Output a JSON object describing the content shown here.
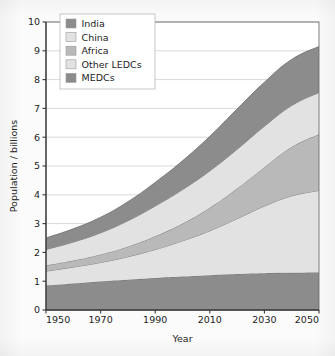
{
  "chart_data": {
    "type": "area",
    "title": "",
    "subtitle": "",
    "xlabel": "Year",
    "ylabel": "Population / billions",
    "xlim": [
      1950,
      2050
    ],
    "ylim": [
      0,
      10
    ],
    "grid": true,
    "stacked": true,
    "legend_position": "top-left",
    "xticks": [
      1950,
      1970,
      1990,
      2010,
      2030,
      2050
    ],
    "xtick_labels": [
      "1950",
      "1970",
      "1990",
      "2010",
      "2030",
      "2050"
    ],
    "yticks": [
      0,
      1,
      2,
      3,
      4,
      5,
      6,
      7,
      8,
      9,
      10
    ],
    "ytick_labels": [
      "0",
      "1",
      "2",
      "3",
      "4",
      "5",
      "6",
      "7",
      "8",
      "9",
      "10"
    ],
    "x": [
      1950,
      1960,
      1970,
      1980,
      1990,
      2000,
      2010,
      2020,
      2030,
      2040,
      2050
    ],
    "series": [
      {
        "name": "MEDCs",
        "color": "#8c8c8c",
        "stack_order": 1,
        "values": [
          0.85,
          0.92,
          0.99,
          1.05,
          1.11,
          1.16,
          1.21,
          1.25,
          1.28,
          1.29,
          1.3
        ]
      },
      {
        "name": "Other LEDCs",
        "color": "#e2e2e2",
        "stack_order": 2,
        "values": [
          0.5,
          0.57,
          0.66,
          0.8,
          0.99,
          1.24,
          1.54,
          1.92,
          2.33,
          2.67,
          2.85
        ]
      },
      {
        "name": "Africa",
        "color": "#b9b9b9",
        "stack_order": 3,
        "values": [
          0.2,
          0.23,
          0.28,
          0.35,
          0.46,
          0.6,
          0.8,
          1.05,
          1.35,
          1.7,
          1.95
        ]
      },
      {
        "name": "China",
        "color": "#e2e2e2",
        "stack_order": 4,
        "values": [
          0.55,
          0.64,
          0.75,
          0.9,
          1.05,
          1.18,
          1.28,
          1.36,
          1.42,
          1.44,
          1.45
        ]
      },
      {
        "name": "India",
        "color": "#8c8c8c",
        "stack_order": 5,
        "values": [
          0.4,
          0.46,
          0.54,
          0.66,
          0.82,
          1.0,
          1.2,
          1.4,
          1.53,
          1.6,
          1.6
        ]
      }
    ],
    "cumulative_tops": {
      "MEDCs": [
        0.85,
        0.92,
        0.99,
        1.05,
        1.11,
        1.16,
        1.21,
        1.25,
        1.28,
        1.29,
        1.3
      ],
      "Other LEDCs": [
        1.35,
        1.49,
        1.65,
        1.85,
        2.1,
        2.4,
        2.75,
        3.17,
        3.61,
        3.96,
        4.15
      ],
      "Africa": [
        1.55,
        1.72,
        1.93,
        2.2,
        2.56,
        3.0,
        3.55,
        4.22,
        4.96,
        5.66,
        6.1
      ],
      "China": [
        2.1,
        2.36,
        2.68,
        3.1,
        3.61,
        4.18,
        4.83,
        5.58,
        6.38,
        7.1,
        7.55
      ],
      "India": [
        2.5,
        2.82,
        3.22,
        3.76,
        4.43,
        5.18,
        6.03,
        6.98,
        7.91,
        8.7,
        9.15
      ]
    },
    "legend": [
      {
        "label": "India",
        "color": "#8c8c8c"
      },
      {
        "label": "China",
        "color": "#e2e2e2"
      },
      {
        "label": "Africa",
        "color": "#b9b9b9"
      },
      {
        "label": "Other LEDCs",
        "color": "#e2e2e2"
      },
      {
        "label": "MEDCs",
        "color": "#8c8c8c"
      }
    ]
  },
  "axes": {
    "y_title": "Population / billions",
    "x_title": "Year"
  },
  "style": {
    "grid_color": "#cfcfcf",
    "axis_color": "#3a3a3a",
    "band_edge_color": "#6e6e6e",
    "plot_background": "#ffffff",
    "page_background": "#fbfbfb"
  }
}
